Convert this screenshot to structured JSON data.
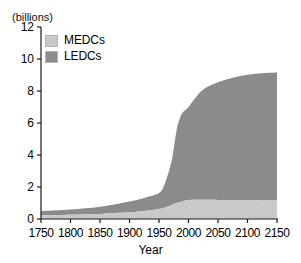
{
  "chart_data": {
    "type": "area",
    "stacked": true,
    "title": "",
    "subtitle": "",
    "unit_label": "(billions)",
    "xlabel": "Year",
    "ylabel": "",
    "xlim": [
      1750,
      2150
    ],
    "ylim": [
      0,
      12
    ],
    "grid": false,
    "legend_position": "top-left",
    "x": [
      1750,
      1800,
      1850,
      1900,
      1925,
      1950,
      1960,
      1970,
      1975,
      1980,
      1985,
      1990,
      2000,
      2010,
      2025,
      2050,
      2075,
      2100,
      2125,
      2150
    ],
    "xticks": [
      1750,
      1800,
      1850,
      1900,
      1950,
      2000,
      2050,
      2100,
      2150
    ],
    "yticks": [
      0,
      2,
      4,
      6,
      8,
      10,
      12
    ],
    "series": [
      {
        "name": "MEDCs",
        "color": "#c9c9c9",
        "values": [
          0.22,
          0.26,
          0.32,
          0.42,
          0.5,
          0.62,
          0.72,
          0.85,
          0.92,
          1.0,
          1.05,
          1.1,
          1.18,
          1.2,
          1.2,
          1.19,
          1.18,
          1.17,
          1.16,
          1.15
        ]
      },
      {
        "name": "LEDCs",
        "color": "#8b8b8b",
        "values": [
          0.28,
          0.34,
          0.45,
          0.68,
          0.82,
          1.0,
          1.5,
          2.55,
          3.5,
          4.6,
          5.2,
          5.55,
          5.82,
          6.3,
          6.9,
          7.35,
          7.65,
          7.85,
          7.95,
          8.0
        ]
      }
    ],
    "totals": [
      0.5,
      0.6,
      0.77,
      1.1,
      1.32,
      1.62,
      2.22,
      3.4,
      4.42,
      5.6,
      6.25,
      6.65,
      7.0,
      7.5,
      8.1,
      8.54,
      8.83,
      9.02,
      9.11,
      9.15
    ]
  },
  "legend": {
    "items": [
      {
        "label": "MEDCs"
      },
      {
        "label": "LEDCs"
      }
    ]
  },
  "colors": {
    "medcs": "#c9c9c9",
    "ledcs": "#8b8b8b",
    "axis": "#1a1a1a",
    "background": "#ffffff"
  }
}
